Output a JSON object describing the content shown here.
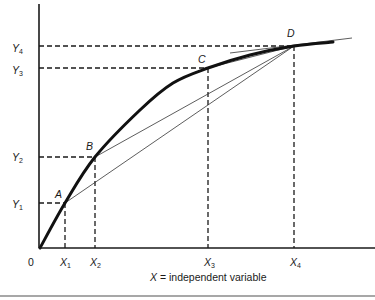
{
  "figure": {
    "origin_label": "0",
    "x_axis_caption": {
      "variable": "X",
      "text": " = independent variable"
    },
    "points": [
      {
        "name": "A",
        "x_var": "X",
        "x_sub": "1",
        "y_var": "Y",
        "y_sub": "1"
      },
      {
        "name": "B",
        "x_var": "X",
        "x_sub": "2",
        "y_var": "Y",
        "y_sub": "2"
      },
      {
        "name": "C",
        "x_var": "X",
        "x_sub": "3",
        "y_var": "Y",
        "y_sub": "3"
      },
      {
        "name": "D",
        "x_var": "X",
        "x_sub": "4",
        "y_var": "Y",
        "y_sub": "4"
      }
    ]
  },
  "geometry": {
    "y_axis": {
      "x1": 39,
      "y1": 4,
      "x2": 39,
      "y2": 248
    },
    "x_axis": {
      "x1": 39,
      "y1": 248,
      "x2": 375,
      "y2": 248
    },
    "bottom_rule": {
      "x1": 0,
      "y1": 296,
      "x2": 375,
      "y2": 296
    },
    "curve_points": [
      [
        40,
        248
      ],
      [
        65,
        203
      ],
      [
        95,
        157
      ],
      [
        140,
        110
      ],
      [
        173,
        83
      ],
      [
        208,
        68
      ],
      [
        250,
        55
      ],
      [
        294,
        46
      ],
      [
        333,
        42
      ]
    ],
    "point_coords": [
      [
        65,
        203
      ],
      [
        95,
        157
      ],
      [
        208,
        68
      ],
      [
        294,
        46
      ]
    ],
    "tangent": {
      "x1": 230,
      "y1": 53,
      "x2": 352,
      "y2": 38
    },
    "label_positions": {
      "point_labels": [
        [
          55,
          198
        ],
        [
          86,
          150
        ],
        [
          198,
          63
        ],
        [
          287,
          37
        ]
      ],
      "y_labels": [
        [
          12,
          208
        ],
        [
          12,
          161
        ],
        [
          12,
          74
        ],
        [
          12,
          52
        ]
      ],
      "x_labels": [
        [
          60,
          266
        ],
        [
          90,
          266
        ],
        [
          204,
          266
        ],
        [
          290,
          266
        ]
      ],
      "origin": [
        28,
        266
      ],
      "caption": [
        150,
        281
      ]
    }
  }
}
